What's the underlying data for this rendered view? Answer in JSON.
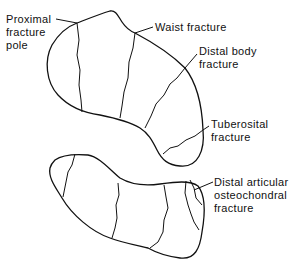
{
  "diagram": {
    "labels": {
      "proximal_pole": [
        "Proximal",
        "fracture",
        "pole"
      ],
      "waist": [
        "Waist fracture"
      ],
      "distal_body": [
        "Distal body",
        "fracture"
      ],
      "tuberosital": [
        "Tuberosital",
        "fracture"
      ],
      "distal_articular": [
        "Distal articular",
        "osteochondral",
        "fracture"
      ]
    },
    "colors": {
      "line": "#111111",
      "background": "#ffffff"
    }
  }
}
